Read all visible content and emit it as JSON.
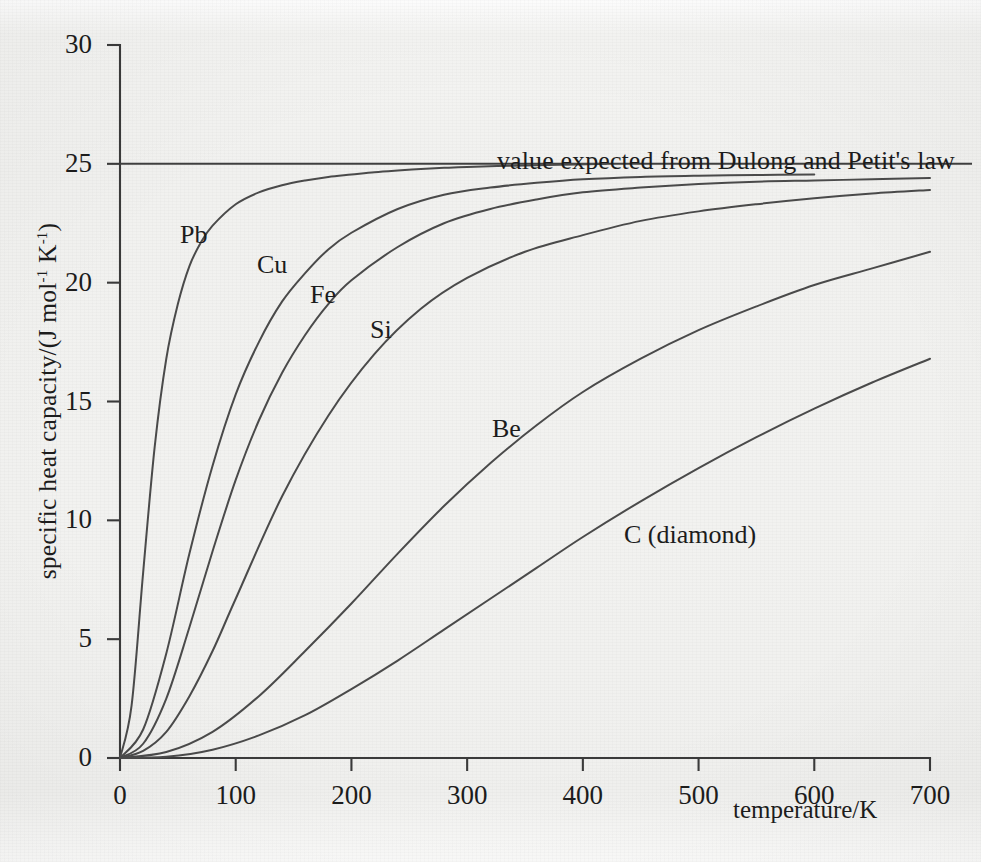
{
  "figure": {
    "background_color": "#f2f2f0",
    "ink_color": "#3a3a3a"
  },
  "axes": {
    "y_title": "specific heat capacity/(J mol",
    "y_title_sup1": "-1",
    "y_title_mid": " K",
    "y_title_sup2": "-1",
    "y_title_end": ")",
    "x_title": "temperature/K",
    "y_ticks": [
      "0",
      "5",
      "10",
      "15",
      "20",
      "25",
      "30"
    ],
    "x_ticks": [
      "0",
      "100",
      "200",
      "300",
      "400",
      "500",
      "600",
      "700"
    ]
  },
  "annotations": {
    "dulong_petit": "value expected from Dulong and Petit's law"
  },
  "curve_labels": {
    "pb": "Pb",
    "cu": "Cu",
    "fe": "Fe",
    "si": "Si",
    "be": "Be",
    "c_diamond": "C (diamond)"
  },
  "chart_data": {
    "type": "line",
    "title": "",
    "subtitle": "",
    "xlabel": "temperature/K",
    "ylabel": "specific heat capacity/(J mol-1 K-1)",
    "xlim": [
      0,
      700
    ],
    "ylim": [
      0,
      30
    ],
    "xticks": [
      0,
      100,
      200,
      300,
      400,
      500,
      600,
      700
    ],
    "yticks": [
      0,
      5,
      10,
      15,
      20,
      25,
      30
    ],
    "grid": false,
    "legend": "inline-curve-labels",
    "annotations": [
      {
        "text": "value expected from Dulong and Petit's law",
        "x": 300,
        "y": 25,
        "kind": "horizontal-reference-line",
        "value": 25
      }
    ],
    "series": [
      {
        "name": "Pb",
        "debye_temperature_K": 88,
        "x": [
          0,
          10,
          20,
          30,
          40,
          50,
          60,
          70,
          80,
          100,
          120,
          140,
          160,
          180,
          200,
          220,
          240,
          260,
          280,
          300,
          340,
          380,
          420
        ],
        "y": [
          0,
          2.2,
          7.8,
          13.1,
          16.8,
          19.1,
          20.7,
          21.7,
          22.4,
          23.3,
          23.8,
          24.1,
          24.3,
          24.45,
          24.55,
          24.65,
          24.72,
          24.78,
          24.83,
          24.87,
          24.92,
          24.96,
          25.0
        ]
      },
      {
        "name": "Cu",
        "debye_temperature_K": 172,
        "x": [
          0,
          20,
          40,
          60,
          80,
          100,
          120,
          140,
          160,
          180,
          200,
          240,
          280,
          320,
          360,
          400,
          450,
          500,
          550,
          600
        ],
        "y": [
          0,
          1.2,
          4.4,
          8.6,
          12.3,
          15.3,
          17.5,
          19.2,
          20.4,
          21.4,
          22.1,
          23.1,
          23.7,
          24.0,
          24.2,
          24.35,
          24.45,
          24.5,
          24.53,
          24.55
        ]
      },
      {
        "name": "Fe",
        "debye_temperature_K": 214,
        "x": [
          0,
          20,
          40,
          60,
          80,
          100,
          120,
          140,
          160,
          180,
          200,
          240,
          280,
          320,
          360,
          400,
          450,
          500,
          550,
          600,
          650,
          700
        ],
        "y": [
          0,
          0.6,
          2.5,
          5.5,
          8.7,
          11.7,
          14.2,
          16.2,
          17.8,
          19.1,
          20.1,
          21.5,
          22.5,
          23.1,
          23.5,
          23.8,
          24.0,
          24.15,
          24.25,
          24.3,
          24.35,
          24.4
        ]
      },
      {
        "name": "Si",
        "debye_temperature_K": 290,
        "x": [
          0,
          20,
          40,
          60,
          80,
          100,
          140,
          180,
          220,
          260,
          300,
          350,
          400,
          450,
          500,
          550,
          600,
          650,
          700
        ],
        "y": [
          0,
          0.3,
          1.1,
          2.6,
          4.5,
          6.7,
          11.0,
          14.4,
          17.0,
          18.9,
          20.2,
          21.3,
          22.0,
          22.6,
          23.0,
          23.3,
          23.55,
          23.75,
          23.9
        ]
      },
      {
        "name": "Be",
        "debye_temperature_K": 560,
        "x": [
          0,
          40,
          80,
          120,
          160,
          200,
          240,
          280,
          320,
          360,
          400,
          450,
          500,
          550,
          600,
          650,
          700
        ],
        "y": [
          0,
          0.25,
          1.1,
          2.6,
          4.5,
          6.5,
          8.6,
          10.6,
          12.4,
          14.0,
          15.4,
          16.8,
          18.0,
          19.0,
          19.9,
          20.6,
          21.3
        ]
      },
      {
        "name": "C (diamond)",
        "debye_temperature_K": 820,
        "x": [
          0,
          40,
          80,
          120,
          160,
          200,
          240,
          280,
          320,
          360,
          400,
          450,
          500,
          550,
          600,
          650,
          700
        ],
        "y": [
          0,
          0.05,
          0.35,
          0.95,
          1.8,
          2.9,
          4.1,
          5.4,
          6.7,
          8.0,
          9.3,
          10.8,
          12.2,
          13.5,
          14.7,
          15.8,
          16.8
        ]
      }
    ]
  }
}
